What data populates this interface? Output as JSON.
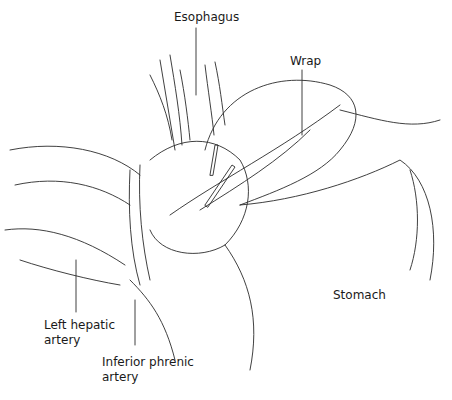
{
  "figure": {
    "type": "anatomical line illustration",
    "labels": {
      "esophagus": "Esophagus",
      "wrap": "Wrap",
      "stomach": "Stomach",
      "left_hepatic_1": "Left hepatic",
      "left_hepatic_2": "artery",
      "inferior_phrenic_1": "Inferior phrenic",
      "inferior_phrenic_2": "artery"
    }
  }
}
